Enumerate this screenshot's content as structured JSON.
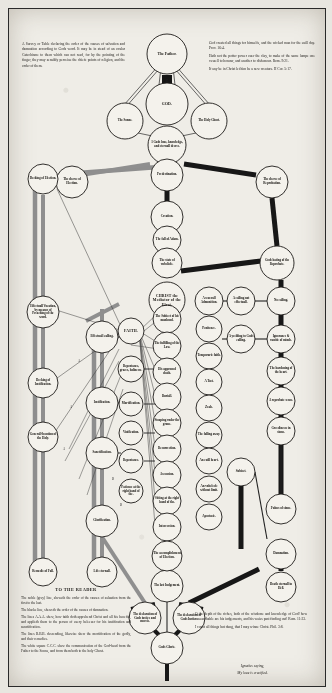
{
  "document": {
    "title": "A Survey or Table declaring the order of the causes of salvation and damnation",
    "paper_color": "#efede7",
    "ink_color": "#15130f",
    "grey_line_color": "#8e8e8e",
    "black_line_color": "#1a1a1a"
  },
  "blocks": {
    "intro": {
      "lines": [
        "A Survey or Table declaring the order of the causes of salvation and damnation according to Gods word. It may be in stead of an ocular Catechisme to them which can not read, for by the pointing of the finger, they may sensibly perceiue the chiefe points of religion, and the order of them."
      ]
    },
    "right_top": {
      "lines": [
        "God created all things for himselfe, and the wicked man for the euill day. Prov. 16:4.",
        "Hath not the potter power ouer the clay, to make of the same lumpe one vessell to honour, and another to dishonour. Rom. 9:21.",
        "If any be in Christ let him be a new creature. II Cor. 5:17."
      ]
    },
    "to_the_reader": {
      "heading": "TO THE READER",
      "lines": [
        "The noble (grey) line, sheweth the order of the causes of saluation from the first to the last.",
        "The blacke line, sheweth the order of the causes of damnation.",
        "The lines A.A.A. shew, how faith doth apprehend Christ and all his benefits, and applieth them to the person of euery beleeuer for his iustification and sanctification.",
        "The lines B.B.B. descending, likewise shew the mortification of the godly, and their remedies.",
        "The white square C.C.C. shew the communication of the God-head from the Father to the Sonne, and from them both to the holy Ghost."
      ]
    },
    "bottom_right": {
      "lines": [
        "O the depth of the riches, both of the wisdome and knowledge of God! how vnsearchable are his iudgements, and his waies past finding out! Rom. 11:33.",
        "I count all things but dung, that I may winne Christ. Phil. 3:8."
      ]
    },
    "ignatius": {
      "lines": [
        "Ignatius saying,",
        "My loue is crucified."
      ]
    }
  },
  "nodes": {
    "trinity": [
      {
        "id": "father",
        "label": "The Father.",
        "cx": 158,
        "cy": 45,
        "r": 20,
        "size": "big"
      },
      {
        "id": "god",
        "label": "GOD.",
        "cx": 158,
        "cy": 95,
        "r": 21,
        "size": "caps"
      },
      {
        "id": "sonne",
        "label": "The Sonne.",
        "cx": 116,
        "cy": 112,
        "r": 18,
        "size": ""
      },
      {
        "id": "holy-ghost",
        "label": "The Holy Ghost.",
        "cx": 200,
        "cy": 112,
        "r": 18,
        "size": ""
      },
      {
        "id": "gods-decree",
        "label": "1 Gods loue, knowledge, and eternall decree.",
        "cx": 158,
        "cy": 136,
        "r": 19,
        "size": ""
      }
    ],
    "spine": [
      {
        "id": "predestination",
        "label": "Predestination.",
        "cx": 158,
        "cy": 166,
        "r": 16,
        "size": ""
      },
      {
        "id": "creation",
        "label": "Creation.",
        "cx": 158,
        "cy": 208,
        "r": 16,
        "size": ""
      },
      {
        "id": "fall-of-adam",
        "label": "The fall of Adam.",
        "cx": 158,
        "cy": 231,
        "r": 14,
        "size": ""
      },
      {
        "id": "state-of-unbelief",
        "label": "The state of vnbeliefe.",
        "cx": 158,
        "cy": 254,
        "r": 15,
        "size": ""
      },
      {
        "id": "christ-mediator",
        "label": "CHRIST the Mediator of the Elect.",
        "cx": 158,
        "cy": 291,
        "r": 18,
        "size": "caps"
      },
      {
        "id": "last-judgement",
        "label": "The last Iudgement.",
        "cx": 158,
        "cy": 577,
        "r": 16,
        "size": ""
      },
      {
        "id": "gods-glorie",
        "label": "Gods Glorie.",
        "cx": 158,
        "cy": 639,
        "r": 16,
        "size": ""
      }
    ],
    "decrees": [
      {
        "id": "decree-election",
        "label": "The decree of Election.",
        "cx": 63,
        "cy": 173,
        "r": 16,
        "size": ""
      },
      {
        "id": "decree-reprobation",
        "label": "The decree of Reprobation.",
        "cx": 263,
        "cy": 173,
        "r": 16,
        "size": ""
      },
      {
        "id": "gods-hating",
        "label": "Gods hating of the Reprobate.",
        "cx": 268,
        "cy": 254,
        "r": 17,
        "size": ""
      }
    ],
    "left_outer": [
      {
        "id": "decking-election",
        "label": "Decking of Election.",
        "cx": 34,
        "cy": 170,
        "r": 15,
        "size": ""
      },
      {
        "id": "effectuall-vocation",
        "label": "Effectuall Vocation, by meanes of Preaching of the word.",
        "cx": 34,
        "cy": 303,
        "r": 16,
        "size": ""
      },
      {
        "id": "decking-justification",
        "label": "Decking of Iustification.",
        "cx": 34,
        "cy": 374,
        "r": 15,
        "size": ""
      },
      {
        "id": "generall-call",
        "label": "Generall-locution of the Holy.",
        "cx": 34,
        "cy": 428,
        "r": 15,
        "size": ""
      },
      {
        "id": "remedie-fall",
        "label": "Remedie of Fall.",
        "cx": 34,
        "cy": 563,
        "r": 14,
        "size": ""
      }
    ],
    "elect_chain": [
      {
        "id": "effectuall-calling",
        "label": "Effectuall calling.",
        "cx": 93,
        "cy": 328,
        "r": 16,
        "size": ""
      },
      {
        "id": "justification",
        "label": "Iustification.",
        "cx": 93,
        "cy": 394,
        "r": 16,
        "size": ""
      },
      {
        "id": "sanctification",
        "label": "Sanctification.",
        "cx": 93,
        "cy": 444,
        "r": 16,
        "size": ""
      },
      {
        "id": "glorification",
        "label": "Glorification.",
        "cx": 93,
        "cy": 512,
        "r": 16,
        "size": ""
      },
      {
        "id": "life-eternall",
        "label": "Life eternall.",
        "cx": 93,
        "cy": 563,
        "r": 15,
        "size": ""
      }
    ],
    "faith_col": [
      {
        "id": "faith",
        "label": "FAITH.",
        "cx": 122,
        "cy": 322,
        "r": 13,
        "size": "caps"
      },
      {
        "id": "repentance-graces",
        "label": "Repentance, graces, holinesse.",
        "cx": 122,
        "cy": 360,
        "r": 13,
        "size": ""
      },
      {
        "id": "mortification",
        "label": "Mortification.",
        "cx": 122,
        "cy": 395,
        "r": 12,
        "size": ""
      },
      {
        "id": "vivification",
        "label": "Viuification.",
        "cx": 122,
        "cy": 424,
        "r": 12,
        "size": ""
      },
      {
        "id": "repentance",
        "label": "Repentance.",
        "cx": 122,
        "cy": 452,
        "r": 12,
        "size": ""
      },
      {
        "id": "patience",
        "label": "Patience at the right hand of the.",
        "cx": 122,
        "cy": 482,
        "r": 12,
        "size": ""
      }
    ],
    "christ_col": [
      {
        "id": "subject-manhood",
        "label": "The Subiect of his manhood.",
        "cx": 158,
        "cy": 310,
        "r": 14,
        "size": ""
      },
      {
        "id": "fulfilling-law",
        "label": "The fulfilling of the Law.",
        "cx": 158,
        "cy": 337,
        "r": 14,
        "size": ""
      },
      {
        "id": "approved-death",
        "label": "His approued death.",
        "cx": 158,
        "cy": 363,
        "r": 14,
        "size": ""
      },
      {
        "id": "buriall",
        "label": "Buriall.",
        "cx": 158,
        "cy": 388,
        "r": 14,
        "size": ""
      },
      {
        "id": "stooping-graue",
        "label": "Stooping vnder the graue.",
        "cx": 158,
        "cy": 414,
        "r": 14,
        "size": ""
      },
      {
        "id": "resurrection",
        "label": "Resurrection.",
        "cx": 158,
        "cy": 440,
        "r": 14,
        "size": ""
      },
      {
        "id": "ascension",
        "label": "Ascension.",
        "cx": 158,
        "cy": 466,
        "r": 14,
        "size": ""
      },
      {
        "id": "sitting-right-hand",
        "label": "Sitting at the right hand of the.",
        "cx": 158,
        "cy": 492,
        "r": 14,
        "size": ""
      },
      {
        "id": "intercession",
        "label": "Intercession.",
        "cx": 158,
        "cy": 518,
        "r": 14,
        "size": ""
      },
      {
        "id": "accomplishment-election",
        "label": "The accomplishment of Election.",
        "cx": 158,
        "cy": 547,
        "r": 15,
        "size": ""
      }
    ],
    "reprobate_inner": [
      {
        "id": "a-seuerall-admonition",
        "label": "A seuerall Admonition.",
        "cx": 200,
        "cy": 292,
        "r": 14,
        "size": ""
      },
      {
        "id": "penitence",
        "label": "Penitence.",
        "cx": 200,
        "cy": 320,
        "r": 13,
        "size": ""
      },
      {
        "id": "temporarie-faith",
        "label": "Temporarie faith.",
        "cx": 200,
        "cy": 347,
        "r": 13,
        "size": ""
      },
      {
        "id": "a-tast",
        "label": "A Tast.",
        "cx": 200,
        "cy": 373,
        "r": 13,
        "size": ""
      },
      {
        "id": "zeale",
        "label": "Zeale.",
        "cx": 200,
        "cy": 399,
        "r": 13,
        "size": ""
      },
      {
        "id": "falling-away",
        "label": "The falling away.",
        "cx": 200,
        "cy": 426,
        "r": 13,
        "size": ""
      },
      {
        "id": "an-euill-heart",
        "label": "An euill heart.",
        "cx": 200,
        "cy": 452,
        "r": 13,
        "size": ""
      },
      {
        "id": "vnbeleefe-limit",
        "label": "An vnbeleefe without limit.",
        "cx": 200,
        "cy": 480,
        "r": 13,
        "size": ""
      },
      {
        "id": "apostasie",
        "label": "Apostasie.",
        "cx": 200,
        "cy": 508,
        "r": 13,
        "size": ""
      }
    ],
    "reprobate_outer": [
      {
        "id": "calling-not-effectuall",
        "label": "A calling not effectuall.",
        "cx": 232,
        "cy": 292,
        "r": 14,
        "size": ""
      },
      {
        "id": "yeelding-to-calling",
        "label": "A yeelding to Gods calling.",
        "cx": 232,
        "cy": 330,
        "r": 14,
        "size": ""
      },
      {
        "id": "no-calling",
        "label": "No calling.",
        "cx": 272,
        "cy": 292,
        "r": 14,
        "size": ""
      },
      {
        "id": "ignorance-vanity",
        "label": "Ignorance & vanitie of minde.",
        "cx": 272,
        "cy": 330,
        "r": 14,
        "size": ""
      },
      {
        "id": "hardening-heart",
        "label": "The hardening of the heart.",
        "cx": 272,
        "cy": 362,
        "r": 14,
        "size": ""
      },
      {
        "id": "reprobate-sense",
        "label": "A reprobate sense.",
        "cx": 272,
        "cy": 392,
        "r": 14,
        "size": ""
      },
      {
        "id": "greedinesse-sinne",
        "label": "Greedinesse in sinne.",
        "cx": 272,
        "cy": 422,
        "r": 14,
        "size": ""
      },
      {
        "id": "fulnesse-sinne",
        "label": "Fulnes of sinne.",
        "cx": 272,
        "cy": 500,
        "r": 15,
        "size": ""
      },
      {
        "id": "damnation",
        "label": "Damnation.",
        "cx": 272,
        "cy": 545,
        "r": 15,
        "size": ""
      },
      {
        "id": "death-hell",
        "label": "Death eternall in Hell.",
        "cx": 272,
        "cy": 578,
        "r": 15,
        "size": ""
      },
      {
        "id": "subject",
        "label": "Subiect.",
        "cx": 232,
        "cy": 463,
        "r": 14,
        "size": ""
      }
    ],
    "bottom_pair": [
      {
        "id": "declaration-justice-mercie",
        "label": "The declaration of Gods iustice and mercie.",
        "cx": 136,
        "cy": 609,
        "r": 16,
        "size": ""
      },
      {
        "id": "declaration-justice",
        "label": "The declaration of Gods Iustice.",
        "cx": 180,
        "cy": 609,
        "r": 16,
        "size": ""
      }
    ]
  },
  "markers": [
    {
      "label": "A",
      "x": 70,
      "y": 352
    },
    {
      "label": "A",
      "x": 62,
      "y": 398
    },
    {
      "label": "A",
      "x": 55,
      "y": 440
    },
    {
      "label": "B",
      "x": 104,
      "y": 470
    },
    {
      "label": "B",
      "x": 112,
      "y": 496
    },
    {
      "label": "C",
      "x": 158,
      "y": 72
    }
  ]
}
